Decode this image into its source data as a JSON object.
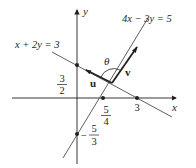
{
  "diagram": {
    "axes": {
      "x_label": "x",
      "y_label": "y"
    },
    "lines": [
      {
        "name": "line-1",
        "equation": "x + 2y = 3"
      },
      {
        "name": "line-2",
        "equation": "4x − 3y = 5"
      }
    ],
    "vectors": [
      {
        "name": "u",
        "label": "u"
      },
      {
        "name": "v",
        "label": "v"
      }
    ],
    "angle_label": "θ",
    "points": {
      "y_intercept_line1": {
        "num": "3",
        "den": "2",
        "sign": ""
      },
      "x_intercept_line1": {
        "value": "3"
      },
      "x_intercept_line2": {
        "num": "5",
        "den": "4",
        "sign": ""
      },
      "y_intercept_line2": {
        "num": "5",
        "den": "3",
        "sign": "−"
      }
    },
    "colors": {
      "ink": "#231f20",
      "line": "#4d4d4f"
    }
  }
}
